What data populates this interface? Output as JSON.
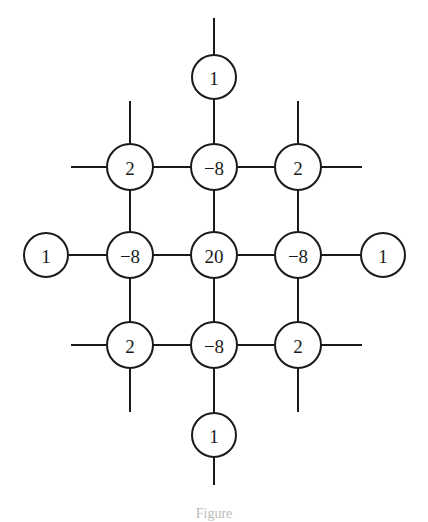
{
  "diagram": {
    "nodes": [
      {
        "id": "n-top",
        "label": "1",
        "x": 214,
        "y": 77
      },
      {
        "id": "n-ul",
        "label": "2",
        "x": 130,
        "y": 167
      },
      {
        "id": "n-um",
        "label": "−8",
        "x": 214,
        "y": 167
      },
      {
        "id": "n-ur",
        "label": "2",
        "x": 298,
        "y": 167
      },
      {
        "id": "n-left",
        "label": "1",
        "x": 46,
        "y": 255
      },
      {
        "id": "n-ml",
        "label": "−8",
        "x": 130,
        "y": 255
      },
      {
        "id": "n-center",
        "label": "20",
        "x": 214,
        "y": 255
      },
      {
        "id": "n-mr",
        "label": "−8",
        "x": 298,
        "y": 255
      },
      {
        "id": "n-right",
        "label": "1",
        "x": 383,
        "y": 255
      },
      {
        "id": "n-ll",
        "label": "2",
        "x": 130,
        "y": 345
      },
      {
        "id": "n-lm",
        "label": "−8",
        "x": 214,
        "y": 345
      },
      {
        "id": "n-lr",
        "label": "2",
        "x": 298,
        "y": 345
      },
      {
        "id": "n-bottom",
        "label": "1",
        "x": 214,
        "y": 435
      }
    ],
    "caption": "Figure"
  }
}
